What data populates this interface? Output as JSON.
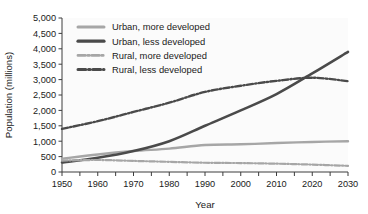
{
  "chart_data": {
    "type": "line",
    "title": "",
    "xlabel": "Year",
    "ylabel": "Population (millions)",
    "xlim": [
      1950,
      2030
    ],
    "ylim": [
      0,
      5000
    ],
    "grid": false,
    "legend_position": "top-left-inside",
    "x_tick_labels": [
      "1950",
      "1960",
      "1970",
      "1980",
      "1990",
      "2000",
      "2010",
      "2020",
      "2030"
    ],
    "x_ticks": [
      1950,
      1960,
      1970,
      1980,
      1990,
      2000,
      2010,
      2020,
      2030
    ],
    "y_tick_labels": [
      "0",
      "500",
      "1,000",
      "1,500",
      "2,000",
      "2,500",
      "3,000",
      "3,500",
      "4,000",
      "4,500",
      "5,000"
    ],
    "y_ticks": [
      0,
      500,
      1000,
      1500,
      2000,
      2500,
      3000,
      3500,
      4000,
      4500,
      5000
    ],
    "x": [
      1950,
      1960,
      1970,
      1980,
      1990,
      2000,
      2010,
      2020,
      2030
    ],
    "series": [
      {
        "name": "Urban, more developed",
        "color": "#a6a6a6",
        "style": "solid",
        "width": 2.4,
        "values": [
          430,
          570,
          680,
          760,
          875,
          900,
          940,
          975,
          1000
        ]
      },
      {
        "name": "Urban, less developed",
        "color": "#4a4a4a",
        "style": "solid",
        "width": 2.6,
        "values": [
          310,
          460,
          680,
          1000,
          1500,
          2000,
          2530,
          3200,
          3900
        ]
      },
      {
        "name": "Rural, more developed",
        "color": "#a6a6a6",
        "style": "dashdot",
        "width": 2.2,
        "values": [
          370,
          390,
          360,
          330,
          300,
          290,
          270,
          240,
          200
        ]
      },
      {
        "name": "Rural, less developed",
        "color": "#4a4a4a",
        "style": "dashdot",
        "width": 2.4,
        "values": [
          1400,
          1650,
          1950,
          2250,
          2600,
          2800,
          2960,
          3060,
          2950
        ]
      }
    ],
    "annotations": [
      {
        "text": "Urban, less developed crosses Rural, less developed near 2018 at about 3,050 million"
      }
    ]
  },
  "legend": {
    "entries": [
      {
        "label": "Urban, more developed"
      },
      {
        "label": "Urban, less developed"
      },
      {
        "label": "Rural, more developed"
      },
      {
        "label": "Rural, less developed"
      }
    ]
  }
}
